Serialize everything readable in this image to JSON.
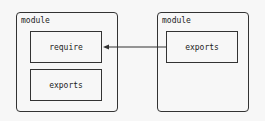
{
  "diagram": {
    "left_module": {
      "label": "module",
      "boxes": [
        {
          "label": "require"
        },
        {
          "label": "exports"
        }
      ]
    },
    "right_module": {
      "label": "module",
      "boxes": [
        {
          "label": "exports"
        }
      ]
    },
    "edges": [
      {
        "from": "right_module.exports",
        "to": "left_module.require",
        "type": "arrow"
      }
    ],
    "colors": {
      "stroke": "#333333",
      "background": "#f7f7f7"
    }
  }
}
